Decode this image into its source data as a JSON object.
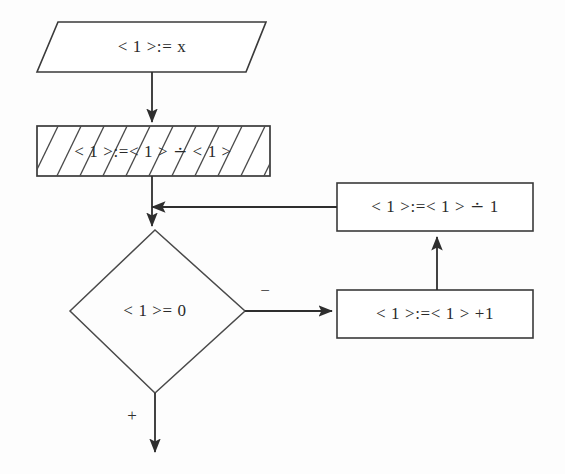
{
  "diagram": {
    "canvas": {
      "width": 565,
      "height": 474
    },
    "background_color": "#fdfdfd",
    "stroke_color": "#2e2e2e",
    "text_color": "#2a2a2a",
    "nodes": [
      {
        "id": "input",
        "shape": "parallelogram",
        "label": "< 1 >:= x",
        "label_plain": "<1>:=x",
        "italic_tail": "x"
      },
      {
        "id": "hatched-process",
        "shape": "rectangle-hatched",
        "label": "< 1 >:=< 1 > ∸ < 1 >",
        "label_plain": "<1>:=<1> ∸ <1>",
        "hatched": "true"
      },
      {
        "id": "decision",
        "shape": "diamond",
        "label": "< 1 >= 0",
        "label_plain": "<1>=0"
      },
      {
        "id": "decrement",
        "shape": "rectangle",
        "label": "< 1 >:=< 1 > ∸ 1",
        "label_plain": "<1>:=<1> ∸ 1"
      },
      {
        "id": "increment",
        "shape": "rectangle",
        "label": "< 1 >:=< 1 > +1",
        "label_plain": "<1>:=<1>+1"
      }
    ],
    "edges": [
      {
        "id": "input-to-hatched",
        "from": "input",
        "to": "hatched-process",
        "label": ""
      },
      {
        "id": "hatched-to-decision",
        "from": "hatched-process",
        "to": "decision",
        "label": ""
      },
      {
        "id": "decision-minus",
        "from": "decision",
        "to": "increment",
        "label": "−"
      },
      {
        "id": "increment-to-decrement",
        "from": "increment",
        "to": "decrement",
        "label": ""
      },
      {
        "id": "decrement-feedback",
        "from": "decrement",
        "to": "hatched-to-decision",
        "label": ""
      },
      {
        "id": "decision-plus",
        "from": "decision",
        "to": "exit",
        "label": "+"
      }
    ]
  }
}
